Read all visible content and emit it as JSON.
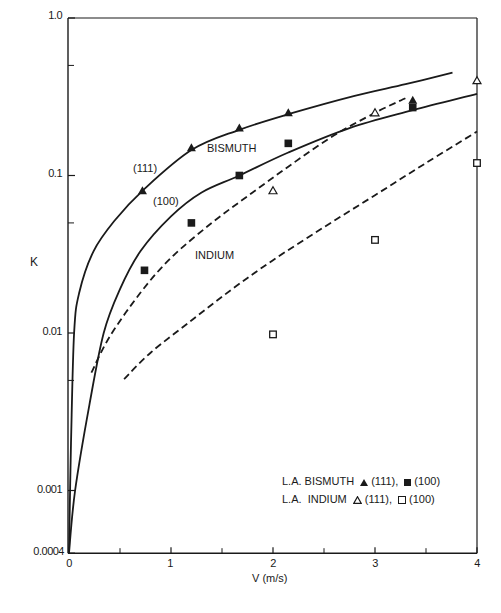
{
  "chart_data": {
    "type": "line",
    "title": "",
    "xlabel": "V (m/s)",
    "ylabel": "K",
    "xlim": [
      0,
      4
    ],
    "ylim": [
      0.0004,
      1.0
    ],
    "yscale": "log",
    "grid": false,
    "x_ticks": [
      0,
      1,
      2,
      3,
      4
    ],
    "x_minor_ticks": [
      0.5,
      1.5,
      2.5,
      3.5
    ],
    "y_ticks": [
      {
        "value": 1.0,
        "label": "1.0"
      },
      {
        "value": 0.1,
        "label": "0.1"
      },
      {
        "value": 0.01,
        "label": "0.01"
      },
      {
        "value": 0.001,
        "label": "0.001"
      },
      {
        "value": 0.0004,
        "label": "0.0004"
      }
    ],
    "y_minor_ticks": [
      0.5,
      0.05,
      0.005
    ],
    "series": [
      {
        "name": "Bismuth (111) fit",
        "style": "solid",
        "x": [
          0,
          0.02,
          0.05,
          0.1,
          0.24,
          0.45,
          0.72,
          1.2,
          1.67,
          2.15,
          2.8,
          3.3,
          3.76
        ],
        "y": [
          0.0004,
          0.002,
          0.01,
          0.018,
          0.033,
          0.052,
          0.08,
          0.145,
          0.195,
          0.245,
          0.32,
          0.38,
          0.45
        ]
      },
      {
        "name": "Bismuth (100) fit",
        "style": "solid",
        "x": [
          0,
          0.06,
          0.2,
          0.34,
          0.5,
          0.7,
          1.0,
          1.3,
          1.67,
          2.15,
          2.75,
          3.37,
          4.0
        ],
        "y": [
          0.0004,
          0.001,
          0.0035,
          0.01,
          0.019,
          0.033,
          0.055,
          0.078,
          0.1,
          0.14,
          0.2,
          0.26,
          0.33
        ]
      },
      {
        "name": "Indium (111) fit",
        "style": "dashed",
        "x": [
          0.22,
          0.4,
          0.7,
          1.0,
          1.4,
          1.8,
          2.2,
          2.6,
          3.0,
          3.3
        ],
        "y": [
          0.0056,
          0.0095,
          0.018,
          0.03,
          0.05,
          0.078,
          0.12,
          0.18,
          0.25,
          0.31
        ]
      },
      {
        "name": "Indium (100) fit",
        "style": "dashed",
        "x": [
          0.54,
          0.8,
          1.2,
          1.6,
          2.0,
          2.5,
          3.0,
          3.5,
          4.0
        ],
        "y": [
          0.0051,
          0.0075,
          0.012,
          0.019,
          0.029,
          0.047,
          0.075,
          0.12,
          0.19
        ]
      },
      {
        "name": "L.A. Bismuth (111)",
        "style": "marker",
        "marker": "filled-triangle",
        "x": [
          0.72,
          1.2,
          1.67,
          2.15,
          3.37
        ],
        "y": [
          0.08,
          0.15,
          0.2,
          0.25,
          0.3
        ]
      },
      {
        "name": "L.A. Bismuth (100)",
        "style": "marker",
        "marker": "filled-square",
        "x": [
          0.74,
          1.2,
          1.67,
          2.15,
          3.37
        ],
        "y": [
          0.025,
          0.05,
          0.1,
          0.16,
          0.27
        ]
      },
      {
        "name": "L.A. Indium (111)",
        "style": "marker",
        "marker": "open-triangle",
        "x": [
          2.0,
          3.0,
          4.0
        ],
        "y": [
          0.08,
          0.25,
          0.4
        ]
      },
      {
        "name": "L.A. Indium (100)",
        "style": "marker",
        "marker": "open-square",
        "x": [
          2.0,
          3.0,
          4.0
        ],
        "y": [
          0.0098,
          0.039,
          0.12
        ]
      }
    ],
    "annotations": [
      {
        "text": "BISMUTH",
        "x": 1.4,
        "y": 0.12
      },
      {
        "text": "(111)",
        "x": 0.62,
        "y": 0.11
      },
      {
        "text": "(100)",
        "x": 0.95,
        "y": 0.065
      },
      {
        "text": "INDIUM",
        "x": 1.55,
        "y": 0.027
      }
    ],
    "legend": {
      "position": "lower right",
      "entries": [
        {
          "prefix": "L.A. BISMUTH",
          "items": [
            {
              "marker": "filled-triangle",
              "label": "(111),"
            },
            {
              "marker": "filled-square",
              "label": "(100)"
            }
          ]
        },
        {
          "prefix": "L.A.  INDIUM",
          "items": [
            {
              "marker": "open-triangle",
              "label": "(111),"
            },
            {
              "marker": "open-square",
              "label": "(100)"
            }
          ]
        }
      ]
    }
  },
  "labels": {
    "ylabel": "K",
    "xlabel": "V (m/s)",
    "bismuth": "BISMUTH",
    "indium": "INDIUM",
    "p111": "(111)",
    "p100": "(100)",
    "legend_row1_prefix": "L.A. BISMUTH",
    "legend_row1_a": "(111),",
    "legend_row1_b": "(100)",
    "legend_row2_prefix": "L.A.  INDIUM",
    "legend_row2_a": "(111),",
    "legend_row2_b": "(100)",
    "yt_1": "1.0",
    "yt_01": "0.1",
    "yt_001": "0.01",
    "yt_0001": "0.001",
    "yt_00004": "0.0004",
    "xt_0": "0",
    "xt_1": "1",
    "xt_2": "2",
    "xt_3": "3",
    "xt_4": "4"
  }
}
